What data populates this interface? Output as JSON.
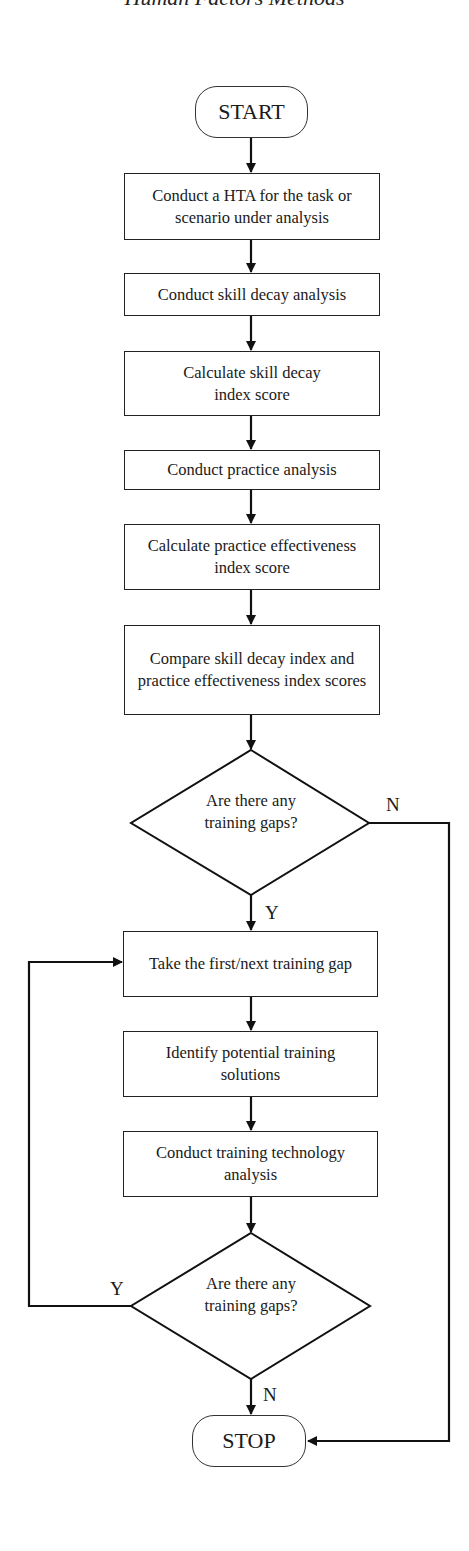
{
  "header": {
    "running_title": "Human Factors Methods"
  },
  "flowchart": {
    "start": "START",
    "stop": "STOP",
    "steps": [
      "Conduct a HTA for the task or scenario under analysis",
      "Conduct skill decay analysis",
      "Calculate skill decay index score",
      "Conduct practice analysis",
      "Calculate practice effectiveness index score",
      "Compare skill decay index and practice effectiveness index scores",
      "Take the first/next training gap",
      "Identify potential training solutions",
      "Conduct training technology analysis"
    ],
    "decisions": [
      {
        "question": "Are there any training gaps?",
        "yes_label": "Y",
        "no_label": "N"
      },
      {
        "question": "Are there any training gaps?",
        "yes_label": "Y",
        "no_label": "N"
      }
    ]
  }
}
